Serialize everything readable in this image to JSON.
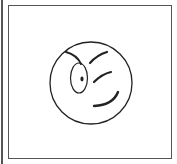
{
  "image": {
    "subject": "winking-smiley-face",
    "stroke_color": "#222222",
    "frame_color": "#555555",
    "background": "#ffffff"
  }
}
